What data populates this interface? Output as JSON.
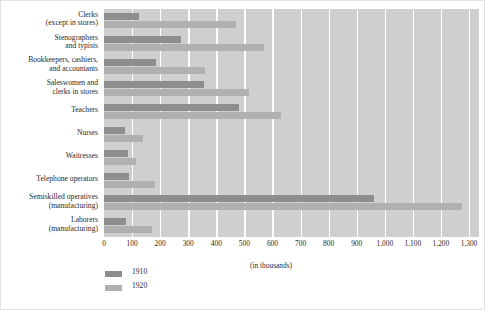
{
  "chart_data": {
    "type": "bar",
    "orientation": "horizontal",
    "title": "",
    "subtitle": "",
    "xlabel": "(in thousands)",
    "ylabel": "",
    "xlim": [
      0,
      1300
    ],
    "xticks": [
      "0",
      "100",
      "200",
      "300",
      "400",
      "500",
      "600",
      "700",
      "800",
      "900",
      "1,000",
      "1,100",
      "1,200",
      "1,300"
    ],
    "xtick_values": [
      0,
      100,
      200,
      300,
      400,
      500,
      600,
      700,
      800,
      900,
      1000,
      1100,
      1200,
      1300
    ],
    "grid": "vertical-white-gridlines",
    "legend_position": "below-left",
    "categories": [
      "Clerks\n(except in stores)",
      "Stenographers\nand typists",
      "Bookkeepers, cashiers,\nand accountants",
      "Saleswomen and\nclerks in stores",
      "Teachers",
      "Nurses",
      "Waitresses",
      "Telephone operators",
      "Semiskilled operatives\n(manufacturing)",
      "Laborers\n(manufacturing)"
    ],
    "series": [
      {
        "name": "1910",
        "color": "#8e8e8e",
        "values": [
          125,
          275,
          185,
          355,
          480,
          75,
          85,
          88,
          960,
          80
        ]
      },
      {
        "name": "1920",
        "color": "#b0b0b0",
        "values": [
          470,
          570,
          360,
          515,
          630,
          140,
          115,
          180,
          1275,
          170
        ]
      }
    ]
  },
  "legend": {
    "items": [
      {
        "label": "1910",
        "color": "#8e8e8e"
      },
      {
        "label": "1920",
        "color": "#b0b0b0"
      }
    ]
  },
  "colors": {
    "plot_background": "#cfcfcf",
    "gridline": "#ffffff",
    "series_1910": "#8e8e8e",
    "series_1920": "#b0b0b0",
    "text": "#2a2a2a",
    "frame": "#e2e2e2"
  }
}
